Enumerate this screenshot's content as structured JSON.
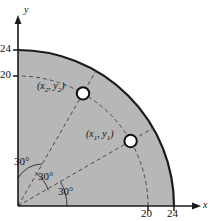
{
  "figure": {
    "kind": "polar-quadrant-diagram",
    "fill_color": "#b7b7b7",
    "line_color": "#1a1a1a",
    "dash_color": "#555555",
    "marker_fill": "#ffffff"
  },
  "axes": {
    "x_label": "x",
    "y_label": "y",
    "x_ticks": [
      {
        "label": "20",
        "value": 20
      },
      {
        "label": "24",
        "value": 24
      }
    ],
    "y_ticks": [
      {
        "label": "20",
        "value": 20
      },
      {
        "label": "24",
        "value": 24
      }
    ]
  },
  "arcs": {
    "outer_radius_label": "24",
    "outer_radius": 24,
    "inner_radius_label": "20",
    "inner_radius": 20
  },
  "angles": [
    {
      "label": "30°",
      "value": 30
    },
    {
      "label": "30°",
      "value": 30
    },
    {
      "label": "30°",
      "value": 30
    }
  ],
  "points": [
    {
      "name": "point-1",
      "label_open": "(",
      "label_x": "x",
      "label_xsub": "1",
      "label_sep": ", ",
      "label_y": "y",
      "label_ysub": "1",
      "label_close": ")",
      "radius": 20,
      "angle_deg": 30
    },
    {
      "name": "point-2",
      "label_open": "(",
      "label_x": "x",
      "label_xsub": "2",
      "label_sep": ", ",
      "label_y": "y",
      "label_ysub": "2",
      "label_close": ")",
      "radius": 20,
      "angle_deg": 60
    }
  ]
}
